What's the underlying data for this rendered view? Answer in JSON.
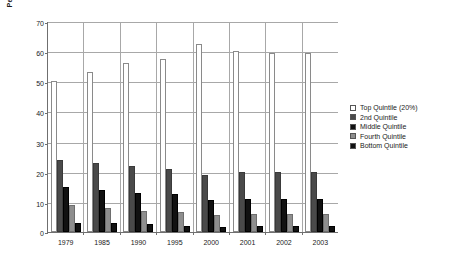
{
  "chart_data": {
    "type": "bar",
    "title": "",
    "xlabel": "",
    "ylabel": "Percentage",
    "ylim": [
      0,
      70
    ],
    "yticks": [
      0,
      10,
      20,
      30,
      40,
      50,
      60,
      70
    ],
    "grid": true,
    "legend_position": "right",
    "categories": [
      "1979",
      "1985",
      "1990",
      "1995",
      "2000",
      "2001",
      "2002",
      "2003"
    ],
    "series": [
      {
        "name": "Top Quintile (20%)",
        "color": "#ffffff",
        "values": [
          50,
          53,
          56,
          57.5,
          62.5,
          60,
          59.5,
          59.5
        ]
      },
      {
        "name": "2nd Quintile",
        "color": "#4a4a4a",
        "values": [
          24,
          23,
          22,
          21,
          19,
          20,
          20,
          20
        ]
      },
      {
        "name": "Middle Quintile",
        "color": "#111111",
        "values": [
          15,
          14,
          13,
          12.5,
          10.5,
          11,
          11,
          11
        ]
      },
      {
        "name": "Fourth Quintile",
        "color": "#8e8e8e",
        "values": [
          9,
          8,
          7,
          6.5,
          5.5,
          6,
          6,
          6
        ]
      },
      {
        "name": "Bottom Quintile",
        "color": "#111111",
        "values": [
          3,
          3,
          2.5,
          2,
          1.5,
          2,
          2,
          2
        ]
      }
    ]
  }
}
